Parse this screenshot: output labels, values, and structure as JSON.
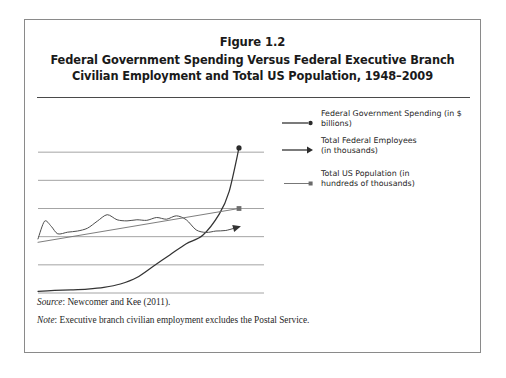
{
  "figure": {
    "number_line": "Figure 1.2",
    "title_line_1": "Federal Government Spending Versus Federal Executive Branch",
    "title_line_2": "Civilian Employment and Total US Population, 1948–2009"
  },
  "legend": {
    "position": "right-inside-plot",
    "items": [
      {
        "label": "Federal Government Spending (in $ billions)",
        "label_lines": [
          "Federal Government Spending (in $ billions)"
        ],
        "marker": "line-with-round-dot-icon",
        "color": "#333333"
      },
      {
        "label": "Total Federal Employees (in thousands)",
        "label_lines": [
          "Total Federal Employees",
          "(in thousands)"
        ],
        "marker": "line-with-arrowhead-icon",
        "color": "#333333"
      },
      {
        "label": "Total US Population (in hundreds of thousands)",
        "label_lines": [
          "Total US Population (in",
          "hundreds of thousands)"
        ],
        "marker": "line-with-square-dot-icon",
        "color": "#666666"
      }
    ]
  },
  "notes": {
    "source_label": "Source",
    "source_text": ": Newcomer and Kee (2011).",
    "note_label": "Note",
    "note_text": ": Executive branch civilian employment excludes the Postal Service."
  },
  "colors": {
    "frame": "#8a8a8a",
    "title_rule": "#4a4a4a",
    "gridline": "#9a9a9a",
    "spending_line": "#333333",
    "employment_line": "#4d4d4d",
    "population_line": "#777777",
    "text": "#1a1a1a"
  },
  "chart_data": {
    "type": "line",
    "title": "Federal Government Spending Versus Federal Executive Branch Civilian Employment and Total US Population, 1948–2009",
    "xlabel": "",
    "ylabel": "",
    "xlim": [
      1948,
      2009
    ],
    "ylim": [
      0,
      6
    ],
    "grid": true,
    "x_axis_labels_shown": false,
    "y_axis_labels_shown": false,
    "gridline_count": 6,
    "gridline_values": [
      5,
      4,
      3,
      2,
      1,
      0
    ],
    "series": [
      {
        "name": "Federal Government Spending (in $ billions)",
        "marker_at_end": "round-dot",
        "x": [
          1948,
          1953,
          1958,
          1963,
          1968,
          1973,
          1978,
          1983,
          1988,
          1993,
          1998,
          2003,
          2006,
          2009
        ],
        "y": [
          0.06,
          0.09,
          0.11,
          0.14,
          0.2,
          0.32,
          0.55,
          0.95,
          1.35,
          1.75,
          2.05,
          2.8,
          3.6,
          5.15
        ]
      },
      {
        "name": "Total Federal Employees (in thousands)",
        "marker_at_end": "arrowhead",
        "x": [
          1948,
          1950,
          1952,
          1954,
          1957,
          1960,
          1963,
          1966,
          1969,
          1972,
          1975,
          1978,
          1981,
          1984,
          1987,
          1990,
          1993,
          1996,
          1999,
          2002,
          2005,
          2009
        ],
        "y": [
          1.92,
          2.55,
          2.37,
          2.1,
          2.16,
          2.2,
          2.3,
          2.55,
          2.78,
          2.6,
          2.56,
          2.6,
          2.58,
          2.68,
          2.62,
          2.74,
          2.6,
          2.24,
          2.15,
          2.2,
          2.22,
          2.35
        ]
      },
      {
        "name": "Total US Population (in hundreds of thousands)",
        "marker_at_end": "square-dot",
        "x": [
          1948,
          2009
        ],
        "y": [
          1.8,
          3.0
        ]
      }
    ]
  }
}
